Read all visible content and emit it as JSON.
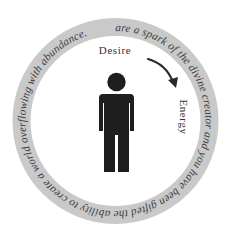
{
  "diagram": {
    "ring_text": "You are a spark of the divine creator and you have been gifted the ability to create a world overflowing with abundance. ",
    "labels": {
      "desire": "Desire",
      "energy": "Energy"
    },
    "colors": {
      "background": "#ffffff",
      "ring": "#c9c9c9",
      "ring_text": "#3c3c3c",
      "figure": "#1e1e1e",
      "arrow": "#2a2a2a",
      "label": "#333333"
    },
    "icons": {
      "figure": "person-icon",
      "arrow": "curved-arrow-icon"
    }
  }
}
